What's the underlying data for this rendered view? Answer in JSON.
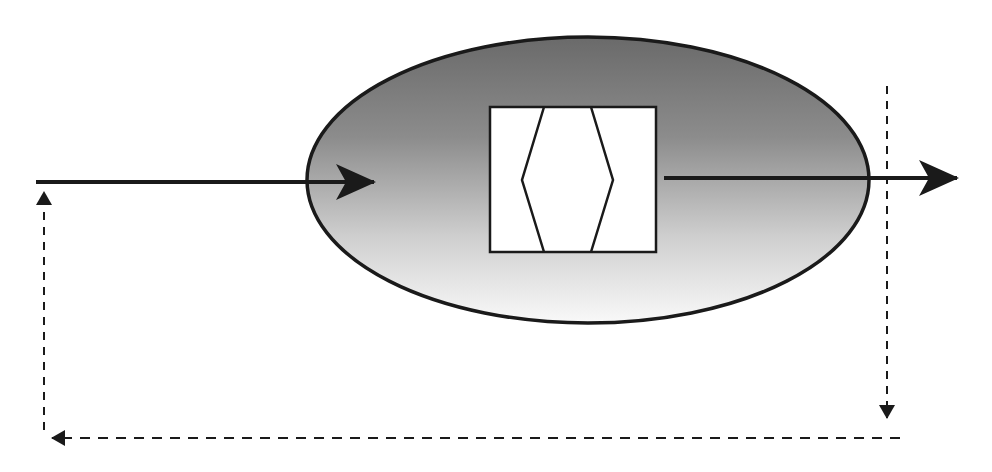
{
  "diagram": {
    "type": "feedback-loop-process",
    "colors": {
      "background": "#ffffff",
      "stroke": "#1a1a1a",
      "ellipse_gradient_top": "#6e6e6e",
      "ellipse_gradient_bottom": "#f8f8f8",
      "box_fill": "#ffffff"
    },
    "ellipse": {
      "cx": 588,
      "cy": 180,
      "rx": 281,
      "ry": 143
    },
    "inner_box": {
      "x": 490,
      "y": 107,
      "width": 166,
      "height": 145
    },
    "inner_hexagon_points": "544,107 522,180 544,252 591,252 613,180 591,107",
    "input_arrow": {
      "x1": 36,
      "y1": 182,
      "x2": 374,
      "y2": 182
    },
    "output_arrow": {
      "x1": 664,
      "y1": 178,
      "x2": 957,
      "y2": 178
    },
    "feedback_path": {
      "down": {
        "x": 887,
        "y1": 86,
        "y2": 418
      },
      "bottom": {
        "y": 438,
        "x1": 900,
        "x2": 52
      },
      "up": {
        "x": 44,
        "y1": 430,
        "y2": 192
      }
    },
    "labels": []
  }
}
